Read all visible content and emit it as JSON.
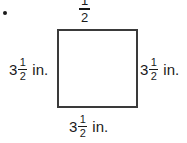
{
  "figure": {
    "shape": "square",
    "bullet": "•",
    "labels": {
      "top": {
        "whole": "",
        "numerator": "1",
        "denominator": "2",
        "unit": ""
      },
      "left": {
        "whole": "3",
        "numerator": "1",
        "denominator": "2",
        "unit": "in."
      },
      "right": {
        "whole": "3",
        "numerator": "1",
        "denominator": "2",
        "unit": "in."
      },
      "bottom": {
        "whole": "3",
        "numerator": "1",
        "denominator": "2",
        "unit": "in."
      }
    },
    "colors": {
      "stroke": "#3a3a3a",
      "text": "#1a1a1a",
      "background": "#ffffff"
    }
  }
}
